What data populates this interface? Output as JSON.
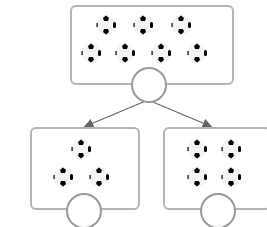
{
  "diagram": {
    "type": "number-bond",
    "top": {
      "ball_count": 7,
      "answer": ""
    },
    "left": {
      "ball_count": 3,
      "answer": ""
    },
    "right": {
      "ball_count": 4,
      "answer": ""
    },
    "colors": {
      "border": "#b5b5b5",
      "circle": "#9a9a9a",
      "arrow": "#666666"
    }
  }
}
